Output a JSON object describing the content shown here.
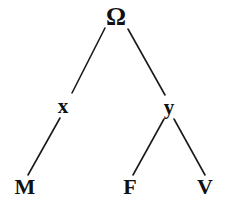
{
  "diagram": {
    "background_color": "#ffffff",
    "stroke_color": "#1a1a1a",
    "text_color": "#111111",
    "nodes": [
      {
        "id": "root",
        "label": "Ω",
        "x": 116,
        "y": 16,
        "level": 0
      },
      {
        "id": "x",
        "label": "x",
        "x": 63,
        "y": 106,
        "level": 1
      },
      {
        "id": "y",
        "label": "y",
        "x": 169,
        "y": 107,
        "level": 1
      },
      {
        "id": "M",
        "label": "M",
        "x": 25,
        "y": 187,
        "level": 2
      },
      {
        "id": "F",
        "label": "F",
        "x": 130,
        "y": 187,
        "level": 2
      },
      {
        "id": "V",
        "label": "V",
        "x": 205,
        "y": 187,
        "level": 2
      }
    ],
    "edges": [
      {
        "id": "root-x",
        "from": "root",
        "to": "x",
        "x1": 105,
        "y1": 28,
        "x2": 72,
        "y2": 93
      },
      {
        "id": "root-y",
        "from": "root",
        "to": "y",
        "x1": 128,
        "y1": 29,
        "x2": 165,
        "y2": 95
      },
      {
        "id": "x-M",
        "from": "x",
        "to": "M",
        "x1": 60,
        "y1": 118,
        "x2": 28,
        "y2": 175
      },
      {
        "id": "y-F",
        "from": "y",
        "to": "F",
        "x1": 164,
        "y1": 119,
        "x2": 133,
        "y2": 175
      },
      {
        "id": "y-V",
        "from": "y",
        "to": "V",
        "x1": 174,
        "y1": 119,
        "x2": 205,
        "y2": 175
      }
    ]
  }
}
